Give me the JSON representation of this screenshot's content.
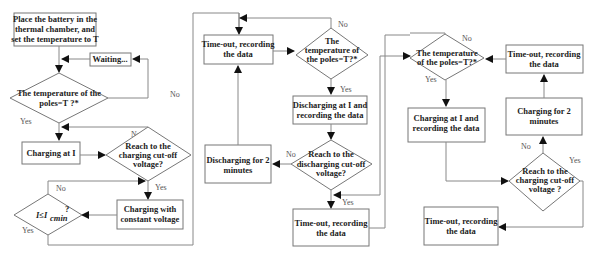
{
  "diagram": {
    "type": "flowchart",
    "title": "",
    "nodes": {
      "place_battery": [
        "Place the battery in the",
        "thermal chamber, and",
        "set the temperature to T"
      ],
      "waiting": [
        "Waiting..."
      ],
      "temp_check_1": [
        "The temperature of the",
        "poles=T ?*"
      ],
      "charging_at_i": [
        "Charging at I"
      ],
      "reach_charge_cutoff_1": [
        "Reach to the",
        "charging cut-off",
        "voltage?"
      ],
      "charging_cv": [
        "Charging with",
        "constant voltage"
      ],
      "current_check": [
        "I≤I",
        "cmin",
        "?"
      ],
      "timeout_1": [
        "Time-out, recording",
        "the data"
      ],
      "temp_check_2": [
        "The",
        "temperature of",
        "the poles=T?*"
      ],
      "discharging_at_i": [
        "Discharging at I and",
        "recording the data"
      ],
      "reach_discharge_cutoff": [
        "Reach to the",
        "discharging cut-off",
        "voltage?"
      ],
      "discharging_2min": [
        "Discharging for 2",
        "minutes"
      ],
      "timeout_2": [
        "Time-out, recording",
        "the data"
      ],
      "temp_check_3": [
        "The temperature",
        "of the poles=T?*"
      ],
      "charging_at_i_rec": [
        "Charging at I and",
        "recording the data"
      ],
      "timeout_3": [
        "Time-out, recording",
        "the data"
      ],
      "charging_2min": [
        "Charging for 2",
        "minutes"
      ],
      "reach_charge_cutoff_2": [
        "Reach to the",
        "charging cut-off",
        "voltage ?"
      ],
      "timeout_4": [
        "Time-out, recording",
        "the data"
      ]
    },
    "edge_labels": {
      "yes": "Yes",
      "no": "No"
    }
  }
}
